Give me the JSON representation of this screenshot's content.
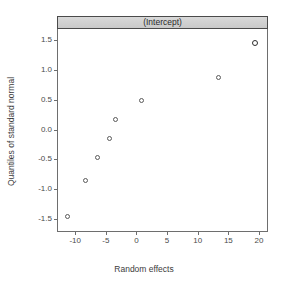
{
  "strip": {
    "label": "(Intercept)"
  },
  "axes": {
    "xlabel": "Random effects",
    "ylabel": "Quantiles of standard normal",
    "xticks": [
      "-10",
      "-5",
      "0",
      "5",
      "10",
      "15",
      "20"
    ],
    "yticks": [
      "1.5",
      "1.0",
      "0.5",
      "0.0",
      "-0.5",
      "-1.0",
      "-1.5"
    ]
  },
  "style": {
    "point_color": "#5a5a5a",
    "frame_color": "#6e6e6e",
    "strip_fill": "#d0d0d0",
    "strip_border": "#4a4a4a",
    "text_color": "#3c3c3c",
    "background": "#ffffff"
  },
  "chart_data": {
    "type": "scatter",
    "title": "(Intercept)",
    "xlabel": "Random effects",
    "ylabel": "Quantiles of standard normal",
    "xlim": [
      -12.8,
      21.3
    ],
    "ylim": [
      -1.68,
      1.68
    ],
    "xticks": [
      -10,
      -5,
      0,
      5,
      10,
      15,
      20
    ],
    "yticks": [
      1.5,
      1.0,
      0.5,
      0.0,
      -0.5,
      -1.0,
      -1.5
    ],
    "grid": false,
    "legend": false,
    "marker": "open-circle",
    "series": [
      {
        "name": "(Intercept)",
        "points": [
          {
            "x": -11.2,
            "y": -1.45,
            "dense": false
          },
          {
            "x": -8.3,
            "y": -0.85,
            "dense": false
          },
          {
            "x": -6.4,
            "y": -0.47,
            "dense": false
          },
          {
            "x": -4.4,
            "y": -0.15,
            "dense": false
          },
          {
            "x": -3.5,
            "y": 0.16,
            "dense": false
          },
          {
            "x": 0.8,
            "y": 0.48,
            "dense": false
          },
          {
            "x": 13.4,
            "y": 0.87,
            "dense": false
          },
          {
            "x": 19.3,
            "y": 1.45,
            "dense": true
          }
        ]
      }
    ]
  }
}
